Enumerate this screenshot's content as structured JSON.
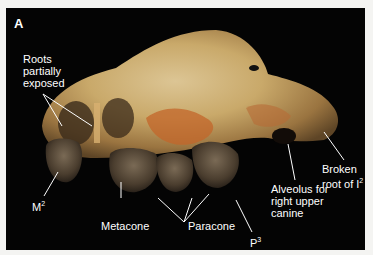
{
  "figure": {
    "panel_letter": "A",
    "background_color": "#040404",
    "bone_colors": [
      "#c9a96a",
      "#d7bb82",
      "#b6833f",
      "#c3652a",
      "#8a6a3c"
    ],
    "tooth_color": "#5a4a38",
    "labels": {
      "roots": [
        "Roots",
        "partially",
        "exposed"
      ],
      "m2": "M",
      "m2_sup": "2",
      "metacone": "Metacone",
      "paracone": "Paracone",
      "p3": "P",
      "p3_sup": "3",
      "alveolus": [
        "Alveolus for",
        "right upper",
        "canine"
      ],
      "broken": [
        "Broken",
        "root of I"
      ],
      "broken_sup": "2"
    }
  }
}
